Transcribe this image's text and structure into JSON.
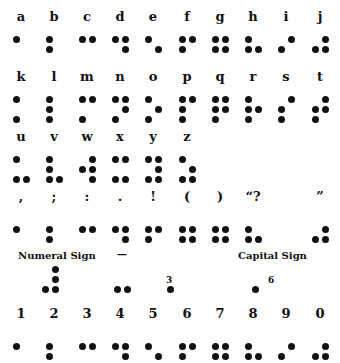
{
  "letters_row1": [
    {
      "label": "a",
      "dots": [
        1
      ]
    },
    {
      "label": "b",
      "dots": [
        1,
        2
      ]
    },
    {
      "label": "c",
      "dots": [
        1,
        4
      ]
    },
    {
      "label": "d",
      "dots": [
        1,
        4,
        5
      ]
    },
    {
      "label": "e",
      "dots": [
        1,
        5
      ]
    },
    {
      "label": "f",
      "dots": [
        1,
        2,
        4
      ]
    },
    {
      "label": "g",
      "dots": [
        1,
        2,
        4,
        5
      ]
    },
    {
      "label": "h",
      "dots": [
        1,
        2,
        5
      ]
    },
    {
      "label": "i",
      "dots": [
        2,
        4
      ]
    },
    {
      "label": "j",
      "dots": [
        2,
        4,
        5
      ]
    }
  ],
  "letters_row2": [
    {
      "label": "k",
      "dots": [
        1,
        3
      ]
    },
    {
      "label": "l",
      "dots": [
        1,
        2,
        3
      ]
    },
    {
      "label": "m",
      "dots": [
        1,
        3,
        4
      ]
    },
    {
      "label": "n",
      "dots": [
        1,
        3,
        4,
        5
      ]
    },
    {
      "label": "o",
      "dots": [
        1,
        3,
        5
      ]
    },
    {
      "label": "p",
      "dots": [
        1,
        2,
        3,
        4
      ]
    },
    {
      "label": "q",
      "dots": [
        1,
        2,
        3,
        4,
        5
      ]
    },
    {
      "label": "r",
      "dots": [
        1,
        2,
        3,
        5
      ]
    },
    {
      "label": "s",
      "dots": [
        2,
        3,
        4
      ]
    },
    {
      "label": "t",
      "dots": [
        2,
        3,
        4,
        5
      ]
    }
  ],
  "letters_row3": [
    {
      "label": "u",
      "dots": [
        1,
        3,
        6
      ]
    },
    {
      "label": "v",
      "dots": [
        1,
        2,
        3,
        6
      ]
    },
    {
      "label": "w",
      "dots": [
        2,
        4,
        5,
        6
      ]
    },
    {
      "label": "x",
      "dots": [
        1,
        3,
        4,
        6
      ]
    },
    {
      "label": "y",
      "dots": [
        1,
        3,
        4,
        5,
        6
      ]
    },
    {
      "label": "z",
      "dots": [
        1,
        3,
        5,
        6
      ]
    }
  ],
  "punctuation_row": [
    {
      "label": ",",
      "dots": [
        2
      ]
    },
    {
      "label": ";",
      "dots": [
        2,
        3
      ]
    },
    {
      "label": ":",
      "dots": [
        2,
        5
      ]
    },
    {
      "label": ".",
      "dots": [
        2,
        5,
        6
      ]
    },
    {
      "label": "!",
      "dots": [
        2,
        3,
        5
      ]
    },
    {
      "label": "(",
      "dots": [
        2,
        3,
        5,
        6
      ]
    },
    {
      "label": ")",
      "dots": [
        2,
        3,
        5,
        6
      ]
    },
    {
      "label": "“?",
      "dots": [
        2,
        3,
        6
      ]
    },
    {
      "label": "",
      "dots": []
    },
    {
      "label": "”",
      "dots": [
        3,
        5,
        6
      ]
    }
  ],
  "signs": {
    "numeral_sign_label": "Numeral Sign",
    "numeral_sign_dots": [
      3,
      4,
      5,
      6
    ],
    "dash_label": "—",
    "dash_dots": [
      3,
      6
    ],
    "apostrophe_label": "3",
    "apostrophe_dots": [
      3
    ],
    "capital_sign_label": "Capital Sign",
    "capital_num_label": "6",
    "capital_sign_dots": [
      6
    ]
  },
  "numbers_row": [
    {
      "label": "1",
      "dots": [
        2
      ]
    },
    {
      "label": "2",
      "dots": [
        2,
        3
      ]
    },
    {
      "label": "3",
      "dots": [
        2,
        5
      ]
    },
    {
      "label": "4",
      "dots": [
        2,
        5,
        6
      ]
    },
    {
      "label": "5",
      "dots": [
        2,
        6
      ]
    },
    {
      "label": "6",
      "dots": [
        2,
        3,
        5
      ]
    },
    {
      "label": "7",
      "dots": [
        2,
        3,
        5,
        6
      ]
    },
    {
      "label": "8",
      "dots": [
        2,
        3,
        6
      ]
    },
    {
      "label": "9",
      "dots": [
        3,
        5
      ]
    },
    {
      "label": "0",
      "dots": [
        3,
        5,
        6
      ]
    }
  ]
}
